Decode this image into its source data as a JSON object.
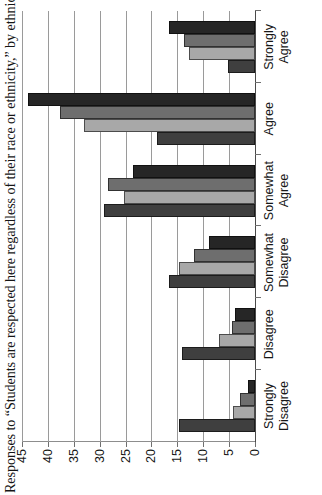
{
  "chart_data": {
    "type": "bar",
    "orientation": "horizontal-rotated",
    "title": "Responses to “Students are respected here regardless of their race or ethnicity,” by ethnicity",
    "xlabel": "",
    "ylabel": "",
    "ylim": [
      0,
      45
    ],
    "ytick_step": 5,
    "yticks": [
      "0",
      "5",
      "10",
      "15",
      "20",
      "25",
      "30",
      "35",
      "40",
      "45"
    ],
    "grid": true,
    "legend": null,
    "categories": [
      "Strongly Disagree",
      "Disagree",
      "Somewhat Disagree",
      "Somewhat Agree",
      "Agree",
      "Strongly Agree"
    ],
    "category_lines": [
      [
        "Strongly",
        "Disagree"
      ],
      [
        "Disagree",
        ""
      ],
      [
        "Somewhat",
        "Disagree"
      ],
      [
        "Somewhat",
        "Agree"
      ],
      [
        "Agree",
        ""
      ],
      [
        "Strongly",
        "Agree"
      ]
    ],
    "series": [
      {
        "name": "Series 1",
        "color": "#3f3f3f",
        "values": [
          14.6,
          14.1,
          16.6,
          29.1,
          19.0,
          5.3
        ]
      },
      {
        "name": "Series 2",
        "color": "#a8a8a8",
        "values": [
          4.3,
          7.0,
          14.6,
          25.4,
          33.0,
          12.7
        ]
      },
      {
        "name": "Series 3",
        "color": "#6e6e6e",
        "values": [
          2.9,
          4.4,
          11.7,
          28.3,
          37.6,
          13.7
        ]
      },
      {
        "name": "Series 4",
        "color": "#262626",
        "values": [
          1.4,
          3.8,
          8.9,
          23.6,
          43.9,
          16.7
        ]
      }
    ]
  },
  "colors": {
    "series_1": "#3f3f3f",
    "series_2": "#a8a8a8",
    "series_3": "#6e6e6e",
    "series_4": "#262626",
    "gridline": "#9a9a9a",
    "axis": "#4a4a4a",
    "text": "#161616",
    "background": "#ffffff"
  }
}
